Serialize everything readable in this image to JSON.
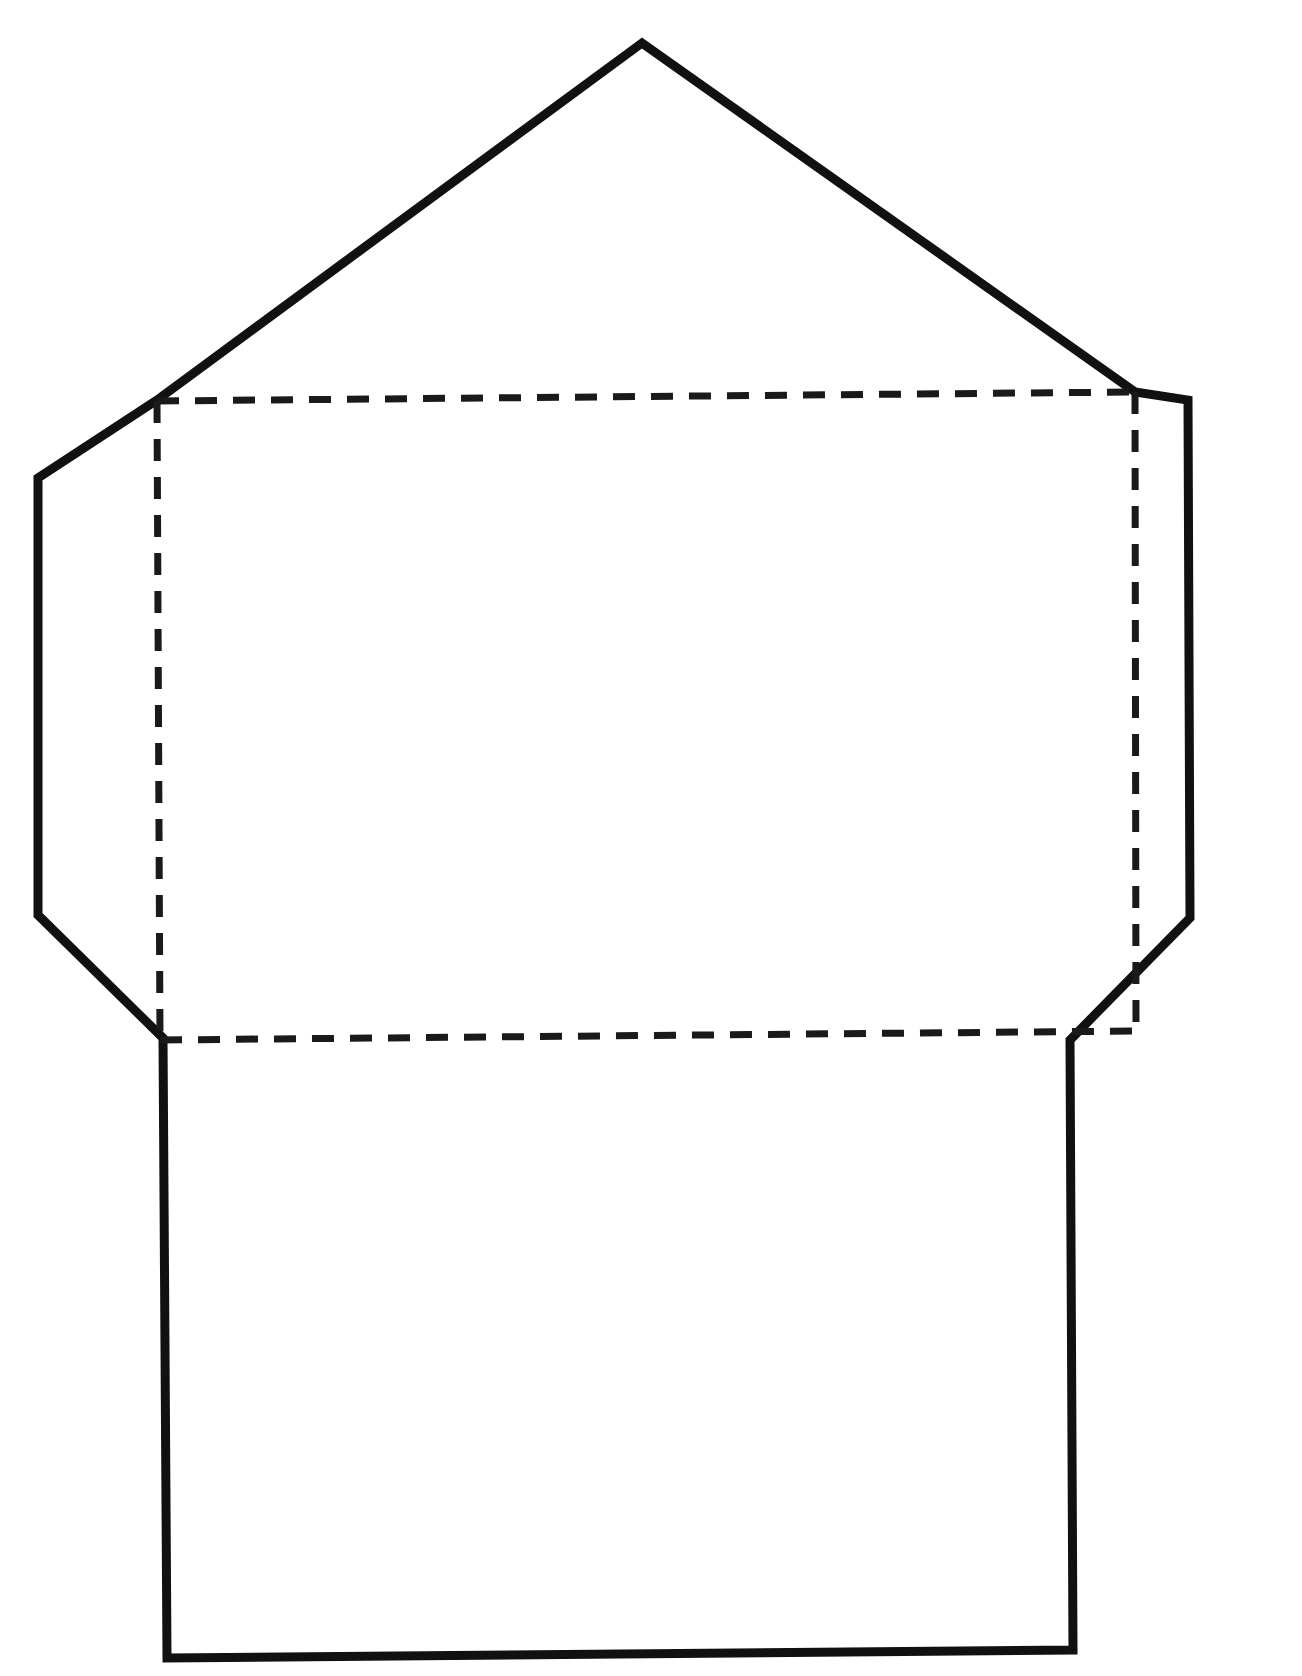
{
  "document": {
    "title": "Envelope Template",
    "page_background": "#ffffff",
    "ink_color": "#111111",
    "width": 1302,
    "height": 1676
  },
  "diagram": {
    "type": "envelope-die-cut-template",
    "line_styles": {
      "cut_label": "solid outline (cut line)",
      "fold_label": "dashed line (fold line)",
      "cut_color": "#111111",
      "fold_color": "#1a1a1a",
      "cut_width": 9,
      "fold_width": 7,
      "fold_dash": "22 16"
    },
    "outline_path": "M 642,43 L 157,400 L 38,478 L 38,915 L 163,1038 L 167,1658 L 1073,1650 L 1070,1040 L 1190,918 L 1188,400 L 1135,392 Z",
    "outline_points": [
      {
        "name": "top-flap-apex",
        "x": 642,
        "y": 43
      },
      {
        "name": "left-flap-top-corner",
        "x": 157,
        "y": 400
      },
      {
        "name": "left-flap-outer-top",
        "x": 38,
        "y": 478
      },
      {
        "name": "left-flap-outer-bottom",
        "x": 38,
        "y": 915
      },
      {
        "name": "left-flap-bottom-corner",
        "x": 163,
        "y": 1038
      },
      {
        "name": "bottom-panel-left",
        "x": 167,
        "y": 1658
      },
      {
        "name": "bottom-panel-right",
        "x": 1073,
        "y": 1650
      },
      {
        "name": "right-flap-bottom-corner",
        "x": 1070,
        "y": 1040
      },
      {
        "name": "right-flap-outer-bottom",
        "x": 1190,
        "y": 918
      },
      {
        "name": "right-flap-outer-top",
        "x": 1188,
        "y": 400
      },
      {
        "name": "right-flap-top-corner",
        "x": 1135,
        "y": 392
      }
    ],
    "fold_lines": [
      {
        "name": "top-fold",
        "x1": 157,
        "y1": 401,
        "x2": 1135,
        "y2": 392
      },
      {
        "name": "bottom-fold",
        "x1": 160,
        "y1": 1040,
        "x2": 1136,
        "y2": 1031
      },
      {
        "name": "left-fold",
        "x1": 157,
        "y1": 401,
        "x2": 160,
        "y2": 1040
      },
      {
        "name": "right-fold",
        "x1": 1135,
        "y1": 392,
        "x2": 1136,
        "y2": 1031
      }
    ],
    "panels": [
      {
        "name": "top-flap",
        "label": ""
      },
      {
        "name": "left-side-flap",
        "label": ""
      },
      {
        "name": "right-side-flap",
        "label": ""
      },
      {
        "name": "center-panel",
        "label": ""
      },
      {
        "name": "bottom-panel",
        "label": ""
      }
    ]
  }
}
